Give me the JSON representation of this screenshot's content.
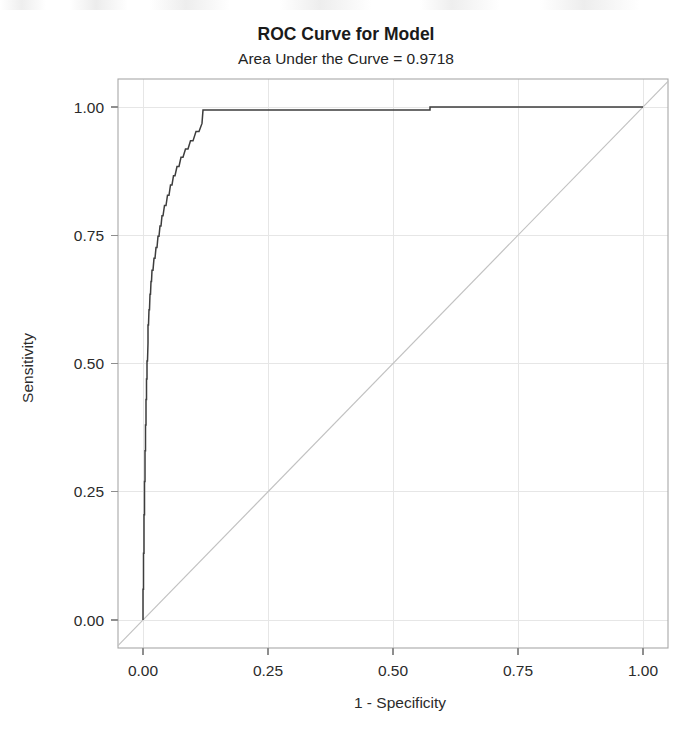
{
  "chart_data": {
    "type": "line",
    "title": "ROC Curve for Model",
    "subtitle": "Area Under the Curve = 0.9718",
    "xlabel": "1 - Specificity",
    "ylabel": "Sensitivity",
    "xlim": [
      0,
      1
    ],
    "ylim": [
      0,
      1
    ],
    "xticks": [
      "0.00",
      "0.25",
      "0.50",
      "0.75",
      "1.00"
    ],
    "xtick_values": [
      0.0,
      0.25,
      0.5,
      0.75,
      1.0
    ],
    "yticks": [
      "0.00",
      "0.25",
      "0.50",
      "0.75",
      "1.00"
    ],
    "ytick_values": [
      0.0,
      0.25,
      0.5,
      0.75,
      1.0
    ],
    "grid": true,
    "legend": "none",
    "auc": 0.9718,
    "series": [
      {
        "name": "ROC Curve",
        "color": "#3d3d3d",
        "style": "step",
        "x": [
          0.0,
          0.0,
          0.001,
          0.001,
          0.002,
          0.002,
          0.003,
          0.003,
          0.004,
          0.004,
          0.005,
          0.005,
          0.006,
          0.006,
          0.007,
          0.007,
          0.008,
          0.008,
          0.009,
          0.01,
          0.01,
          0.011,
          0.012,
          0.013,
          0.014,
          0.015,
          0.016,
          0.017,
          0.018,
          0.02,
          0.022,
          0.024,
          0.026,
          0.028,
          0.03,
          0.032,
          0.034,
          0.036,
          0.038,
          0.04,
          0.043,
          0.046,
          0.049,
          0.052,
          0.055,
          0.058,
          0.061,
          0.064,
          0.068,
          0.072,
          0.076,
          0.08,
          0.085,
          0.09,
          0.095,
          0.1,
          0.106,
          0.112,
          0.118,
          0.12,
          0.574,
          0.574,
          1.0
        ],
        "y": [
          0.0,
          0.06,
          0.06,
          0.13,
          0.13,
          0.205,
          0.205,
          0.27,
          0.27,
          0.33,
          0.33,
          0.38,
          0.38,
          0.43,
          0.43,
          0.47,
          0.47,
          0.505,
          0.505,
          0.54,
          0.575,
          0.575,
          0.605,
          0.605,
          0.635,
          0.635,
          0.66,
          0.66,
          0.682,
          0.682,
          0.705,
          0.705,
          0.726,
          0.726,
          0.748,
          0.748,
          0.768,
          0.768,
          0.788,
          0.788,
          0.808,
          0.808,
          0.828,
          0.828,
          0.848,
          0.848,
          0.866,
          0.866,
          0.884,
          0.884,
          0.902,
          0.902,
          0.918,
          0.918,
          0.934,
          0.934,
          0.952,
          0.952,
          0.968,
          0.994,
          0.994,
          1.0,
          1.0
        ]
      },
      {
        "name": "Reference Line",
        "color": "#c2c2c2",
        "style": "diagonal",
        "x": [
          0.0,
          1.0
        ],
        "y": [
          0.0,
          1.0
        ]
      }
    ]
  },
  "figure": {
    "plot_left_px": 118,
    "plot_top_px": 79,
    "plot_right_px": 668,
    "plot_bottom_px": 648,
    "x_origin_px": 143,
    "x_full_px": 643,
    "y_origin_px": 620,
    "y_full_px": 107
  }
}
